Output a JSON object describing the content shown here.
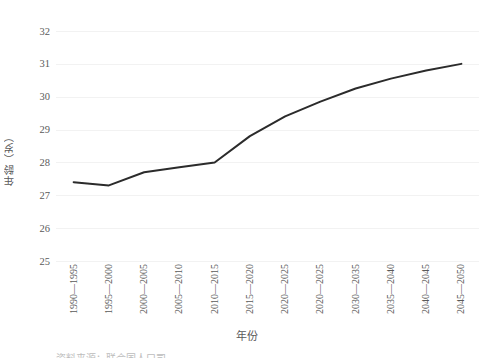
{
  "chart_data": {
    "type": "line",
    "title": "",
    "xlabel": "年份",
    "ylabel": "年龄（岁）",
    "categories": [
      "1990—1995",
      "1995—2000",
      "2000—2005",
      "2005—2010",
      "2010—2015",
      "2015—2020",
      "2020—2025",
      "2020—2025",
      "2030—2035",
      "2035—2040",
      "2040—2045",
      "2045—2050"
    ],
    "values": [
      27.4,
      27.3,
      27.7,
      27.85,
      28.0,
      28.8,
      29.4,
      29.85,
      30.25,
      30.55,
      30.8,
      31.0
    ],
    "ylim": [
      25,
      32
    ],
    "y_ticks": [
      25,
      26,
      27,
      28,
      29,
      30,
      31,
      32
    ],
    "y_tick_labels": [
      "25",
      "26",
      "27",
      "28",
      "29",
      "30",
      "31",
      "32"
    ],
    "grid": true,
    "legend": "none",
    "series_color": "#2b2b2b",
    "grid_color": "#f2f2f2",
    "axis_text_color": "#5a5a5a",
    "background_color": "#ffffff",
    "line_width": 2
  },
  "caption_clipped": "资料来源：联合国人口司"
}
